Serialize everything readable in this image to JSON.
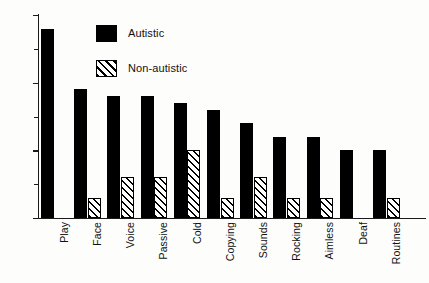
{
  "chart_data": {
    "type": "bar",
    "title": "",
    "subtitle": "",
    "xlabel": "",
    "ylabel": "",
    "ylim": [
      0,
      30
    ],
    "ytick_values": [
      0,
      10,
      20,
      30
    ],
    "ytick_labels": [
      "0",
      "10",
      "20",
      "30"
    ],
    "yminor_ticks": [
      5,
      15,
      25
    ],
    "grid": false,
    "legend_position": "top-center",
    "categories": [
      "Play",
      "Face",
      "Voice",
      "Passive",
      "Cold",
      "Copying",
      "Sounds",
      "Rocking",
      "Aimless",
      "Deaf",
      "Routines"
    ],
    "series": [
      {
        "name": "Autistic",
        "color": "#000000",
        "fill": "solid",
        "values": [
          28,
          19,
          18,
          18,
          17,
          16,
          14,
          12,
          12,
          10,
          10
        ]
      },
      {
        "name": "Non-autistic",
        "color": "#000000",
        "fill": "diagonal-hatch",
        "values": [
          0,
          3,
          6,
          6,
          10,
          3,
          6,
          3,
          3,
          0,
          3
        ]
      }
    ]
  },
  "legend": {
    "entries": [
      {
        "label": "Autistic",
        "fill": "solid"
      },
      {
        "label": "Non-autistic",
        "fill": "diagonal-hatch"
      }
    ]
  }
}
